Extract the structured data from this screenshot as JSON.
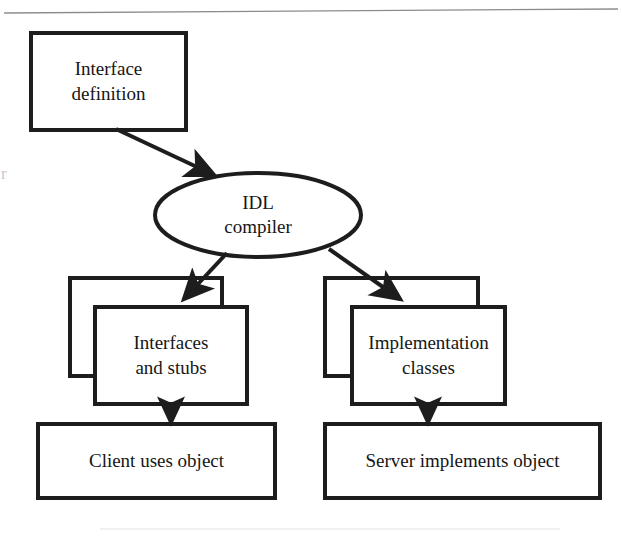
{
  "figure": {
    "kind": "flow-diagram",
    "stroke_color": "#1d1d1d",
    "fill_color": "#ffffff",
    "background_color": "#ffffff",
    "rule_color": "#8c8c8c"
  },
  "nodes": {
    "interface_definition": {
      "shape": "rectangle",
      "line1": "Interface",
      "line2": "definition"
    },
    "idl_compiler": {
      "shape": "ellipse",
      "line1": "IDL",
      "line2": "compiler"
    },
    "interfaces_and_stubs": {
      "shape": "stacked-rectangle",
      "line1": "Interfaces",
      "line2": "and stubs"
    },
    "implementation_classes": {
      "shape": "stacked-rectangle",
      "line1": "Implementation",
      "line2": "classes"
    },
    "client": {
      "shape": "rectangle",
      "line1": "Client uses object"
    },
    "server": {
      "shape": "rectangle",
      "line1": "Server implements object"
    }
  },
  "edges": [
    {
      "id": "edge-definition-to-compiler",
      "from": "interface_definition",
      "to": "idl_compiler",
      "style": "solid-arrow"
    },
    {
      "id": "edge-compiler-to-stubs",
      "from": "idl_compiler",
      "to": "interfaces_and_stubs",
      "style": "solid-arrow"
    },
    {
      "id": "edge-compiler-to-classes",
      "from": "idl_compiler",
      "to": "implementation_classes",
      "style": "solid-arrow"
    },
    {
      "id": "edge-stubs-to-client",
      "from": "interfaces_and_stubs",
      "to": "client",
      "style": "solid-arrow"
    },
    {
      "id": "edge-classes-to-server",
      "from": "implementation_classes",
      "to": "server",
      "style": "solid-arrow"
    }
  ],
  "page_artifacts": {
    "top_rule": "horizontal rule",
    "gutter_mark": "r"
  }
}
